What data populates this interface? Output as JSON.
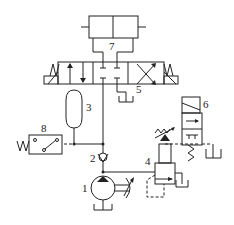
{
  "diagram": {
    "type": "hydraulic-schematic",
    "components": [
      {
        "id": "1",
        "label": "1",
        "name": "variable-displacement pump"
      },
      {
        "id": "2",
        "label": "2",
        "name": "check valve"
      },
      {
        "id": "3",
        "label": "3",
        "name": "accumulator"
      },
      {
        "id": "4",
        "label": "4",
        "name": "relief valve"
      },
      {
        "id": "5",
        "label": "5",
        "name": "4/3 directional control valve"
      },
      {
        "id": "6",
        "label": "6",
        "name": "2/2 solenoid directional valve"
      },
      {
        "id": "7",
        "label": "7",
        "name": "double-acting cylinder"
      },
      {
        "id": "8",
        "label": "8",
        "name": "pressure switch"
      }
    ],
    "colors": {
      "line": "#222222",
      "background": "#ffffff"
    }
  }
}
